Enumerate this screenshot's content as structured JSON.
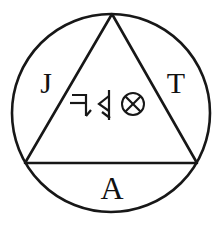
{
  "figure": {
    "background_color": "#ffffff",
    "ink_color": "#171717"
  },
  "circle": {
    "name": "outer-circle",
    "center_x": 111,
    "center_y": 113,
    "radius": 99
  },
  "triangle": {
    "name": "inscribed-triangle",
    "apex_x": 112,
    "apex_y": 14,
    "left_x": 25,
    "left_y": 163,
    "right_x": 197,
    "right_y": 163
  },
  "letters": [
    {
      "id": "letter-j",
      "char": "J",
      "position": "upper-left",
      "x": 46,
      "y": 93
    },
    {
      "id": "letter-t",
      "char": "T",
      "position": "upper-right",
      "x": 176,
      "y": 93
    },
    {
      "id": "letter-a",
      "char": "A",
      "position": "bottom-center",
      "x": 112,
      "y": 199
    }
  ],
  "glyphs": [
    {
      "id": "glyph-hook",
      "name": "hooked-seven-glyph",
      "description": "seven-like stroke with crossbar and lower hook",
      "x": 80,
      "y": 105
    },
    {
      "id": "glyph-chevron",
      "name": "chevron-stave-glyph",
      "description": "vertical stave with left-pointing chevron",
      "x": 106,
      "y": 105
    },
    {
      "id": "glyph-circled-x",
      "name": "circled-x-glyph",
      "description": "circle enclosing a diagonal cross",
      "char": "⊗",
      "x": 133,
      "y": 105
    }
  ]
}
